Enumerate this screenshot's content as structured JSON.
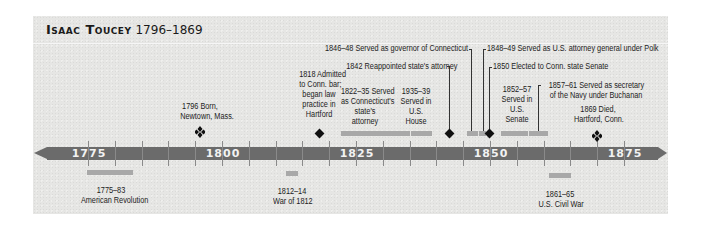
{
  "title": {
    "name": "Isaac Toucey",
    "years": "1796–1869"
  },
  "axis": {
    "labels": [
      "1775",
      "1800",
      "1825",
      "1850",
      "1875"
    ],
    "start_year": 1775,
    "end_year": 1875,
    "tick_interval": 5
  },
  "events_above": [
    {
      "id": "born",
      "text_lines": [
        "1796 Born,",
        "Newtown, Mass."
      ],
      "year": 1796,
      "marker": "quad-diamond"
    },
    {
      "id": "bar",
      "text_lines": [
        "1818 Admitted",
        "to Conn. bar;",
        "began law",
        "practice in",
        "Hartford"
      ],
      "year": 1818,
      "marker": "diamond"
    },
    {
      "id": "state-attorney",
      "text_lines": [
        "1822–35 Served",
        "as Connecticut's",
        "state's",
        "attorney"
      ],
      "start": 1822,
      "end": 1835,
      "marker": "bar"
    },
    {
      "id": "house",
      "text_lines": [
        "1935–39",
        "Served in",
        "U.S.",
        "House"
      ],
      "start": 1835,
      "end": 1839,
      "marker": "bar"
    },
    {
      "id": "reappointed",
      "text": "1842 Reappointed state's attorney",
      "year": 1842,
      "marker": "diamond"
    },
    {
      "id": "governor",
      "text": "1846–48 Served as governor of Connecticut",
      "start": 1846,
      "end": 1848,
      "marker": "bar"
    },
    {
      "id": "attorney-general",
      "text": "1848–49 Served as U.S. attorney general under Polk",
      "start": 1848,
      "end": 1849,
      "marker": "bar"
    },
    {
      "id": "state-senate",
      "text": "1850 Elected to Conn. state Senate",
      "year": 1850,
      "marker": "diamond"
    },
    {
      "id": "senate",
      "text_lines": [
        "1852–57",
        "Served in",
        "U.S.",
        "Senate"
      ],
      "start": 1852,
      "end": 1857,
      "marker": "bar"
    },
    {
      "id": "navy",
      "text_lines": [
        "1857–61 Served as secretary",
        "of the Navy under Buchanan"
      ],
      "start": 1857,
      "end": 1861,
      "marker": "bar"
    },
    {
      "id": "died",
      "text_lines": [
        "1869 Died,",
        "Hartford, Conn."
      ],
      "year": 1869,
      "marker": "quad-diamond"
    }
  ],
  "events_below": [
    {
      "id": "revolution",
      "text_lines": [
        "1775–83",
        "American Revolution"
      ],
      "start": 1775,
      "end": 1783
    },
    {
      "id": "war-1812",
      "text_lines": [
        "1812–14",
        "War of 1812"
      ],
      "start": 1812,
      "end": 1814
    },
    {
      "id": "civil-war",
      "text_lines": [
        "1861–65",
        "U.S. Civil War"
      ],
      "start": 1861,
      "end": 1865
    }
  ],
  "colors": {
    "panel": "#e6e6e4",
    "axis": "#6b6b6b",
    "bar": "#a8a8a8",
    "marker": "#111111",
    "axis_text": "#f2f2f2"
  }
}
